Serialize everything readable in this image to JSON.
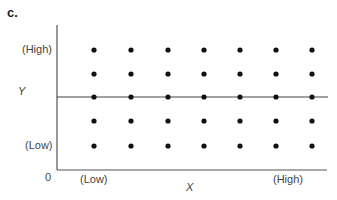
{
  "panel": {
    "label": "c."
  },
  "chart_data": {
    "type": "scatter",
    "title": "",
    "xlabel": "X",
    "ylabel": "Y",
    "origin_label": "0",
    "x_tick_labels": [
      {
        "label": "(Low)",
        "position": "low"
      },
      {
        "label": "(High)",
        "position": "high"
      }
    ],
    "y_tick_labels": [
      {
        "label": "(High)",
        "position": "high"
      },
      {
        "label": "(Low)",
        "position": "low"
      }
    ],
    "x_levels": [
      1,
      2,
      3,
      4,
      5,
      6,
      7
    ],
    "y_levels": [
      1,
      2,
      3,
      4,
      5
    ],
    "points": [
      [
        1,
        1
      ],
      [
        2,
        1
      ],
      [
        3,
        1
      ],
      [
        4,
        1
      ],
      [
        5,
        1
      ],
      [
        6,
        1
      ],
      [
        7,
        1
      ],
      [
        1,
        2
      ],
      [
        2,
        2
      ],
      [
        3,
        2
      ],
      [
        4,
        2
      ],
      [
        5,
        2
      ],
      [
        6,
        2
      ],
      [
        7,
        2
      ],
      [
        1,
        3
      ],
      [
        2,
        3
      ],
      [
        3,
        3
      ],
      [
        4,
        3
      ],
      [
        5,
        3
      ],
      [
        6,
        3
      ],
      [
        7,
        3
      ],
      [
        1,
        4
      ],
      [
        2,
        4
      ],
      [
        3,
        4
      ],
      [
        4,
        4
      ],
      [
        5,
        4
      ],
      [
        6,
        4
      ],
      [
        7,
        4
      ],
      [
        1,
        5
      ],
      [
        2,
        5
      ],
      [
        3,
        5
      ],
      [
        4,
        5
      ],
      [
        5,
        5
      ],
      [
        6,
        5
      ],
      [
        7,
        5
      ]
    ],
    "horizontal_line": {
      "y": 3,
      "description": "flat regression line at mean Y (no relationship)"
    },
    "grid": false,
    "legend": null
  },
  "labels": {
    "y_high": "(High)",
    "y_low": "(Low)",
    "y_axis": "Y",
    "x_low": "(Low)",
    "x_high": "(High)",
    "x_axis": "X",
    "origin": "0"
  }
}
